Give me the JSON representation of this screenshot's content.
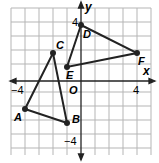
{
  "graph": {
    "x_axis_label": "x",
    "y_axis_label": "y",
    "origin_label": "O",
    "tick_labels": {
      "x_neg": "−4",
      "x_pos": "4",
      "y_pos": "4",
      "y_neg": "−4"
    },
    "grid_range": {
      "xmin": -5,
      "xmax": 5,
      "ymin": -5,
      "ymax": 5
    },
    "colors": {
      "grid": "#b5b5b5",
      "line": "#222222",
      "background": "#ffffff"
    }
  },
  "triangles": [
    {
      "name": "ABC",
      "vertices": [
        {
          "label": "A",
          "x": -4,
          "y": -2
        },
        {
          "label": "B",
          "x": -1,
          "y": -3
        },
        {
          "label": "C",
          "x": -2,
          "y": 2
        }
      ]
    },
    {
      "name": "DEF",
      "vertices": [
        {
          "label": "D",
          "x": 0,
          "y": 4
        },
        {
          "label": "E",
          "x": -1,
          "y": 1
        },
        {
          "label": "F",
          "x": 4,
          "y": 2
        }
      ]
    }
  ]
}
